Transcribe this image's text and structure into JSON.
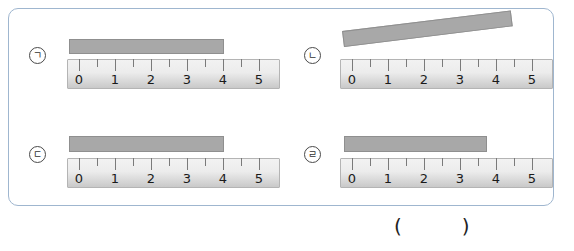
{
  "panel": {
    "border_color": "#9fb6cf"
  },
  "items": [
    {
      "label": "ㄱ",
      "ruler": {
        "numbers": [
          "0",
          "1",
          "2",
          "3",
          "4",
          "5"
        ]
      },
      "bar": {
        "tilted": false
      }
    },
    {
      "label": "ㄴ",
      "ruler": {
        "numbers": [
          "0",
          "1",
          "2",
          "3",
          "4",
          "5"
        ]
      },
      "bar": {
        "tilted": true
      }
    },
    {
      "label": "ㄷ",
      "ruler": {
        "numbers": [
          "0",
          "1",
          "2",
          "3",
          "4",
          "5"
        ]
      },
      "bar": {
        "tilted": false
      }
    },
    {
      "label": "ㄹ",
      "ruler": {
        "numbers": [
          "0",
          "1",
          "2",
          "3",
          "4",
          "5"
        ]
      },
      "bar": {
        "tilted": false
      }
    }
  ],
  "answer": {
    "open": "(",
    "close": ")"
  },
  "colors": {
    "bar_fill": "#a8a8a8",
    "ruler_light": "#f0f0f0",
    "ruler_dark": "#c9c9c9",
    "tick": "#7a7a7a"
  }
}
